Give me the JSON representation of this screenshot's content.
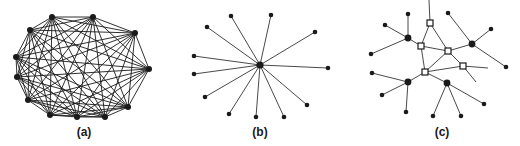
{
  "figure": {
    "panels": [
      {
        "id": "a",
        "label": "(a)",
        "label_x": 84,
        "description": "fully connected network",
        "nodes": [
          [
            52,
            17
          ],
          [
            93,
            17
          ],
          [
            135,
            33
          ],
          [
            149,
            69
          ],
          [
            128,
            107
          ],
          [
            105,
            117
          ],
          [
            77,
            117
          ],
          [
            50,
            115
          ],
          [
            28,
            100
          ],
          [
            17,
            77
          ],
          [
            16,
            57
          ],
          [
            30,
            30
          ]
        ],
        "edges": "complete"
      },
      {
        "id": "b",
        "label": "(b)",
        "label_x": 260,
        "description": "star network",
        "center": [
          260,
          65
        ],
        "leaves": [
          [
            231,
            16
          ],
          [
            271,
            15
          ],
          [
            315,
            32
          ],
          [
            328,
            68
          ],
          [
            307,
            105
          ],
          [
            284,
            117
          ],
          [
            256,
            117
          ],
          [
            229,
            114
          ],
          [
            205,
            97
          ],
          [
            194,
            74
          ],
          [
            194,
            56
          ],
          [
            207,
            27
          ]
        ]
      },
      {
        "id": "c",
        "label": "(c)",
        "label_x": 442,
        "description": "hierarchical network with switching nodes",
        "squares": [
          [
            430,
            23
          ],
          [
            421,
            46
          ],
          [
            448,
            51
          ],
          [
            425,
            72
          ],
          [
            463,
            66
          ]
        ],
        "hubs": [
          [
            408,
            38
          ],
          [
            472,
            44
          ],
          [
            408,
            82
          ],
          [
            447,
            83
          ]
        ],
        "leaves": [
          [
            408,
            14
          ],
          [
            385,
            25
          ],
          [
            371,
            54
          ],
          [
            448,
            13
          ],
          [
            491,
            29
          ],
          [
            506,
            67
          ],
          [
            372,
            73
          ],
          [
            382,
            95
          ],
          [
            406,
            112
          ],
          [
            433,
            116
          ],
          [
            461,
            116
          ],
          [
            484,
            104
          ]
        ],
        "edges": [
          [
            [
              430,
              23
            ],
            [
              429,
              0
            ]
          ],
          [
            [
              430,
              23
            ],
            [
              421,
              46
            ]
          ],
          [
            [
              430,
              23
            ],
            [
              448,
              51
            ]
          ],
          [
            [
              421,
              46
            ],
            [
              448,
              51
            ]
          ],
          [
            [
              421,
              46
            ],
            [
              425,
              72
            ]
          ],
          [
            [
              448,
              51
            ],
            [
              425,
              72
            ]
          ],
          [
            [
              448,
              51
            ],
            [
              463,
              66
            ]
          ],
          [
            [
              425,
              72
            ],
            [
              463,
              66
            ]
          ],
          [
            [
              463,
              66
            ],
            [
              488,
              68
            ]
          ],
          [
            [
              463,
              66
            ],
            [
              476,
              82
            ]
          ],
          [
            [
              448,
              51
            ],
            [
              472,
              44
            ]
          ],
          [
            [
              421,
              46
            ],
            [
              408,
              38
            ]
          ],
          [
            [
              425,
              72
            ],
            [
              408,
              82
            ]
          ],
          [
            [
              425,
              72
            ],
            [
              447,
              83
            ]
          ],
          [
            [
              408,
              38
            ],
            [
              408,
              14
            ]
          ],
          [
            [
              408,
              38
            ],
            [
              385,
              25
            ]
          ],
          [
            [
              408,
              38
            ],
            [
              371,
              54
            ]
          ],
          [
            [
              472,
              44
            ],
            [
              448,
              13
            ]
          ],
          [
            [
              472,
              44
            ],
            [
              491,
              29
            ]
          ],
          [
            [
              472,
              44
            ],
            [
              506,
              67
            ]
          ],
          [
            [
              408,
              82
            ],
            [
              372,
              73
            ]
          ],
          [
            [
              408,
              82
            ],
            [
              382,
              95
            ]
          ],
          [
            [
              408,
              82
            ],
            [
              406,
              112
            ]
          ],
          [
            [
              447,
              83
            ],
            [
              433,
              116
            ]
          ],
          [
            [
              447,
              83
            ],
            [
              461,
              116
            ]
          ],
          [
            [
              447,
              83
            ],
            [
              484,
              104
            ]
          ]
        ]
      }
    ],
    "colors": {
      "ink": "#1a1a1a",
      "background": "#ffffff"
    }
  }
}
